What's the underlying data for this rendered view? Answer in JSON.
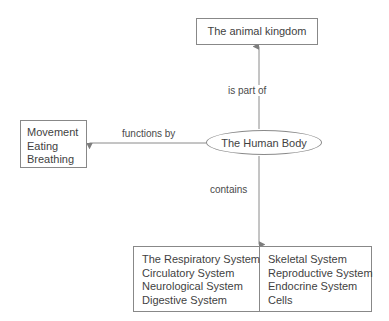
{
  "diagram": {
    "background_color": "#ffffff",
    "line_color": "#8a8a8a",
    "text_color": "#3f3f3f",
    "central_node": {
      "label": "The Human Body",
      "shape": "ellipse"
    },
    "nodes": {
      "animal_kingdom": {
        "label": "The animal kingdom",
        "shape": "rectangle"
      },
      "functions": {
        "shape": "rectangle",
        "lines": [
          "Movement",
          "Eating",
          "Breathing"
        ]
      },
      "systems": {
        "shape": "rectangle",
        "left_column": [
          "The Respiratory System",
          "Circulatory System",
          "Neurological System",
          "Digestive System"
        ],
        "right_column": [
          "Skeletal System",
          "Reproductive System",
          "Endocrine System",
          "Cells"
        ]
      }
    },
    "edges": {
      "is_part_of": "is part of",
      "functions_by": "functions by",
      "contains": "contains"
    }
  }
}
